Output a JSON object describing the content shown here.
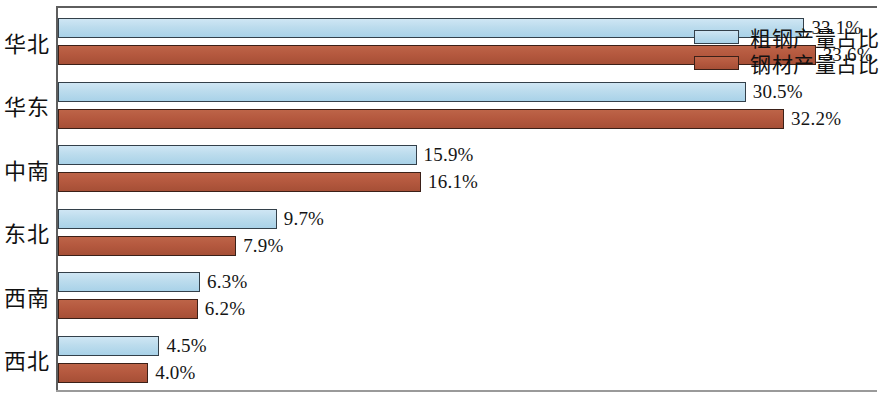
{
  "chart_data": {
    "type": "bar",
    "orientation": "horizontal",
    "title": "",
    "xlabel": "",
    "ylabel": "",
    "categories": [
      "西北",
      "西南",
      "东北",
      "中南",
      "华东",
      "华北"
    ],
    "series": [
      {
        "name": "粗钢产量占比",
        "color": "#bcdced",
        "values": [
          4.5,
          6.3,
          9.7,
          15.9,
          30.5,
          33.1
        ],
        "labels": [
          "4.5%",
          "6.3%",
          "9.7%",
          "15.9%",
          "30.5%",
          "33.1%"
        ]
      },
      {
        "name": "钢材产量占比",
        "color": "#b5593f",
        "values": [
          4.0,
          6.2,
          7.9,
          16.1,
          32.2,
          33.6
        ],
        "labels": [
          "4.0%",
          "6.2%",
          "7.9%",
          "16.1%",
          "32.2%",
          "33.6%"
        ]
      }
    ],
    "xlim": [
      0,
      36.2
    ],
    "grid": false,
    "legend_position": "top-right",
    "value_labels_shown": true
  },
  "legend": {
    "items": [
      {
        "label": "粗钢产量占比"
      },
      {
        "label": "钢材产量占比"
      }
    ]
  }
}
